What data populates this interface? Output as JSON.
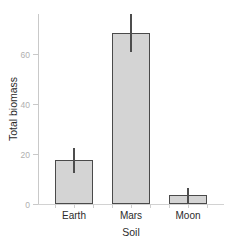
{
  "chart_data": {
    "type": "bar",
    "title": "",
    "subtitle": "",
    "xlabel": "Soil",
    "ylabel": "Total biomass",
    "categories": [
      "Earth",
      "Mars",
      "Moon"
    ],
    "values": [
      17.5,
      68.5,
      3.5
    ],
    "errors": [
      5.0,
      7.5,
      3.0
    ],
    "series": [
      {
        "name": "Total biomass",
        "values": [
          17.5,
          68.5,
          3.5
        ],
        "errors": [
          5.0,
          7.5,
          3.0
        ]
      }
    ],
    "ylim": [
      0,
      76
    ],
    "yticks": [
      0,
      20,
      40,
      60
    ],
    "ytick_labels": [
      "0",
      "20",
      "40",
      "60"
    ],
    "xtick_labels": [
      "Earth",
      "Mars",
      "Moon"
    ],
    "grid": false,
    "legend": false,
    "legend_position": "none",
    "bar_fill_color": "#d4d4d4",
    "bar_edge_color": "#4a4a4a",
    "error_bar_color": "#4d4d4d",
    "axis_color": "#c9c9c9",
    "tick_label_color": "#b0b0b0",
    "axis_label_color": "#2b2b2b",
    "background_color": "#ffffff"
  }
}
